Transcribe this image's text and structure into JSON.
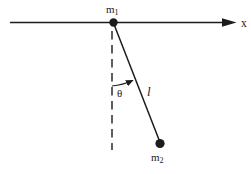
{
  "diagram": {
    "type": "physics-pendulum-figure",
    "colors": {
      "ink": "#1c1c1c",
      "background": "#ffffff"
    },
    "labels": {
      "axis": "x",
      "mass1_base": "m",
      "mass1_sub": "1",
      "mass2_base": "m",
      "mass2_sub": "2",
      "angle": "θ",
      "length": "l"
    }
  }
}
